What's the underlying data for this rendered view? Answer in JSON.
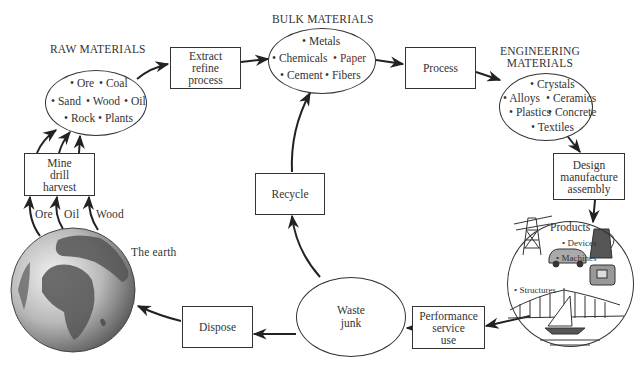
{
  "sections": {
    "raw": {
      "title": "RAW MATERIALS",
      "items": [
        "Ore",
        "Coal",
        "Sand",
        "Wood",
        "Oil",
        "Rock",
        "Plants"
      ]
    },
    "bulk": {
      "title": "BULK MATERIALS",
      "items": [
        "Metals",
        "Chemicals",
        "Paper",
        "Cement",
        "Fibers"
      ]
    },
    "engineering": {
      "title_line1": "ENGINEERING",
      "title_line2": "MATERIALS",
      "items": [
        "Crystals",
        "Alloys",
        "Ceramics",
        "Plastics",
        "Concrete",
        "Textiles"
      ]
    },
    "products": {
      "title": "Products",
      "items": [
        "Devices",
        "Machines",
        "Structures"
      ]
    },
    "waste": {
      "line1": "Waste",
      "line2": "junk"
    },
    "earth": {
      "label": "The earth"
    }
  },
  "processes": {
    "extract": [
      "Extract",
      "refine",
      "process"
    ],
    "process": [
      "Process"
    ],
    "design": [
      "Design",
      "manufacture",
      "assembly"
    ],
    "performance": [
      "Performance",
      "service",
      "use"
    ],
    "dispose": [
      "Dispose"
    ],
    "recycle": [
      "Recycle"
    ],
    "mine": [
      "Mine",
      "drill",
      "harvest"
    ]
  },
  "earth_flows": [
    "Ore",
    "Oil",
    "Wood"
  ],
  "bullet": "•",
  "colors": {
    "stroke": "#333333",
    "text": "#333333",
    "paper_text": "#6b2c1f",
    "background": "#ffffff"
  }
}
